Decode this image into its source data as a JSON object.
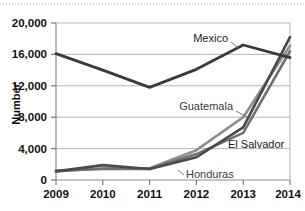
{
  "chart_data": {
    "type": "line",
    "title": "",
    "xlabel": "",
    "ylabel": "Number",
    "x": [
      "2009",
      "2010",
      "2011",
      "2012",
      "2013",
      "2014"
    ],
    "categories": [
      "2009",
      "2010",
      "2011",
      "2012",
      "2013",
      "2014"
    ],
    "ylim": [
      0,
      20000
    ],
    "xlim": [
      "2009",
      "2014"
    ],
    "ytick_labels": [
      "0",
      "4,000",
      "8,000",
      "12,000",
      "16,000",
      "20,000"
    ],
    "ytick_values": [
      0,
      4000,
      8000,
      12000,
      16000,
      20000
    ],
    "xtick_labels": [
      "2009",
      "2010",
      "2011",
      "2012",
      "2013",
      "2014"
    ],
    "grid": "horizontal",
    "legend_position": "inline-labels",
    "series": [
      {
        "name": "Mexico",
        "color": "#3a3a3a",
        "values": [
          16100,
          14000,
          11800,
          14100,
          17200,
          15600
        ]
      },
      {
        "name": "Guatemala",
        "color": "#8e8e8e",
        "values": [
          1100,
          1500,
          1500,
          3800,
          8000,
          17100
        ]
      },
      {
        "name": "El Salvador",
        "color": "#707070",
        "values": [
          1200,
          1400,
          1400,
          3300,
          6000,
          16400
        ]
      },
      {
        "name": "Honduras",
        "color": "#4a4a4a",
        "values": [
          1100,
          1900,
          1400,
          2900,
          6700,
          18200
        ]
      }
    ],
    "annotations": [
      {
        "text": "Mexico",
        "series": "Mexico"
      },
      {
        "text": "Guatemala",
        "series": "Guatemala"
      },
      {
        "text": "El Salvador",
        "series": "El Salvador"
      },
      {
        "text": "Honduras",
        "series": "Honduras"
      }
    ]
  },
  "axes": {
    "y_title": "Number",
    "y_ticks": [
      "20,000",
      "16,000",
      "12,000",
      "8,000",
      "4,000",
      "0"
    ],
    "x_ticks": [
      "2009",
      "2010",
      "2011",
      "2012",
      "2013",
      "2014"
    ]
  },
  "labels": {
    "mexico": "Mexico",
    "guatemala": "Guatemala",
    "el_salvador": "El Salvador",
    "honduras": "Honduras"
  },
  "colors": {
    "mexico": "#3a3a3a",
    "guatemala": "#8e8e8e",
    "el_salvador": "#707070",
    "honduras": "#4a4a4a",
    "gridline": "#b4b4b4",
    "axis": "#8d8d8d",
    "text": "#111111",
    "background": "#ffffff"
  }
}
